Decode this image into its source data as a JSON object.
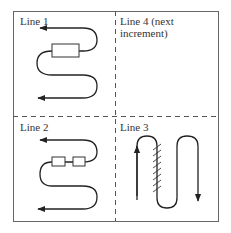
{
  "diagram": {
    "panels": [
      {
        "id": "top-left",
        "label": "Line 1"
      },
      {
        "id": "top-right",
        "label_line1": "Line 4 (next",
        "label_line2": "increment)"
      },
      {
        "id": "bottom-left",
        "label": "Line 2"
      },
      {
        "id": "bottom-right",
        "label": "Line 3"
      }
    ],
    "colors": {
      "stroke": "#222222",
      "border": "#555555"
    }
  }
}
